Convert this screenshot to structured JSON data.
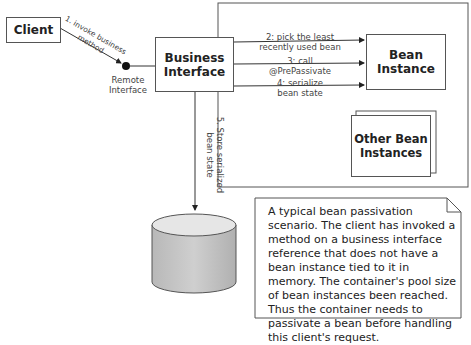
{
  "nodes": {
    "client": "Client",
    "business_interface": "Business Interface",
    "bean_instance": "Bean Instance",
    "other_bean_instances": "Other Bean Instances",
    "remote_interface": "Remote Interface"
  },
  "edges": {
    "step1": "1. invoke business method",
    "step2_line1": "2: pick the least",
    "step2_line2": "recently used bean",
    "step3_line1": "3: call",
    "step3_line2": "@PrePassivate",
    "step4_line1": "4: serialize",
    "step4_line2": "bean state",
    "step5_line1": "5. Store serialized",
    "step5_line2": "bean state"
  },
  "note": {
    "text": "A typical bean passivation scenario. The client has invoked a method on a business interface reference that does not have a bean instance tied to it in memory.  The container's pool size of bean instances been reached.  Thus the container needs to passivate a bean before handling this client's request."
  }
}
